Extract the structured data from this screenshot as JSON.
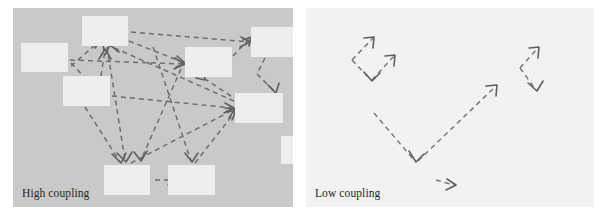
{
  "figure": {
    "type": "diagram",
    "title": "",
    "panel_count": 2
  },
  "panels": [
    {
      "id": "high-coupling",
      "caption": "High coupling",
      "background_color": "#c9c9c9",
      "node_color": "#eeeeee",
      "arrow_color": "#6e6e6e",
      "arrow_style": "dashed",
      "node_count": 9,
      "arrow_count": 17,
      "nodes": [
        {
          "id": "n1",
          "x": 8,
          "y": 35,
          "w": 47,
          "h": 29
        },
        {
          "id": "n2",
          "x": 69,
          "y": 8,
          "w": 46,
          "h": 30
        },
        {
          "id": "n3",
          "x": 50,
          "y": 68,
          "w": 47,
          "h": 30
        },
        {
          "id": "n4",
          "x": 172,
          "y": 39,
          "w": 47,
          "h": 30
        },
        {
          "id": "n5",
          "x": 238,
          "y": 19,
          "w": 47,
          "h": 30
        },
        {
          "id": "n6",
          "x": 222,
          "y": 85,
          "w": 48,
          "h": 30
        },
        {
          "id": "n7",
          "x": 91,
          "y": 157,
          "w": 46,
          "h": 30
        },
        {
          "id": "n8",
          "x": 155,
          "y": 157,
          "w": 47,
          "h": 30
        },
        {
          "id": "n9",
          "x": 268,
          "y": 128,
          "w": 26,
          "h": 28
        }
      ],
      "edges": [
        {
          "from": "n1",
          "to": "n2"
        },
        {
          "from": "n1",
          "to": "n3"
        },
        {
          "from": "n1",
          "to": "n4"
        },
        {
          "from": "n2",
          "to": "n5"
        },
        {
          "from": "n2",
          "to": "n6"
        },
        {
          "from": "n2",
          "to": "n7"
        },
        {
          "from": "n3",
          "to": "n2"
        },
        {
          "from": "n3",
          "to": "n4"
        },
        {
          "from": "n3",
          "to": "n6"
        },
        {
          "from": "n3",
          "to": "n7"
        },
        {
          "from": "n4",
          "to": "n5"
        },
        {
          "from": "n5",
          "to": "n6"
        },
        {
          "from": "n6",
          "to": "n2"
        },
        {
          "from": "n6",
          "to": "n4"
        },
        {
          "from": "n7",
          "to": "n6"
        },
        {
          "from": "n8",
          "to": "n6"
        },
        {
          "from": "n7",
          "to": "n8"
        }
      ]
    },
    {
      "id": "low-coupling",
      "caption": "Low coupling",
      "background_color": "#f2f2f2",
      "node_color": "#f2f2f2",
      "arrow_color": "#6e6e6e",
      "arrow_style": "dashed",
      "node_count": 0,
      "arrow_count": 6,
      "nodes": [],
      "edges": [
        {
          "id": "e1",
          "shape": "up-left"
        },
        {
          "id": "e2",
          "shape": "down-right"
        },
        {
          "id": "e3",
          "shape": "up-right"
        },
        {
          "id": "e4",
          "shape": "v-left-down"
        },
        {
          "id": "e5",
          "shape": "v-right-up"
        },
        {
          "id": "e6",
          "shape": "short-right"
        }
      ]
    }
  ]
}
